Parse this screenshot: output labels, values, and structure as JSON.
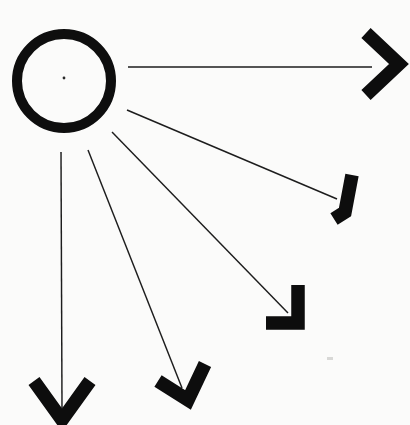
{
  "figure": {
    "background_color": "#fbfbfa",
    "ink_color": "#0d0d0d",
    "line_color": "#1d1d1d",
    "canvas": {
      "width": 410,
      "height": 425
    }
  },
  "ring": {
    "label": "ring",
    "center_x": 64,
    "center_y": 81,
    "outer_radius": 52,
    "stroke_width": 10,
    "color": "#0e0e0e"
  },
  "center_dot": {
    "label": "center-dot",
    "x": 64,
    "y": 78,
    "radius": 1.4,
    "color": "#2a2a2a"
  },
  "speck": {
    "label": "scan-speck",
    "x": 327,
    "y": 357,
    "width": 6,
    "height": 3,
    "color": "#d8d8d6"
  },
  "rays": [
    {
      "name": "ray-east",
      "index": 1,
      "start_x": 128,
      "start_y": 67,
      "end_x": 372,
      "end_y": 67,
      "angle_deg": 0,
      "arrow": {
        "name": "arrowhead-east",
        "tip_x": 399,
        "tip_y": 64,
        "arm_a_x": 366,
        "arm_a_y": 33,
        "arm_b_x": 366,
        "arm_b_y": 95
      }
    },
    {
      "name": "ray-southeast-upper",
      "index": 2,
      "start_x": 127,
      "start_y": 110,
      "end_x": 337,
      "end_y": 199,
      "angle_deg": 23,
      "arrow": {
        "name": "arrowhead-southeast-upper",
        "tip_x": 345,
        "tip_y": 212,
        "arm_a_x": 352,
        "arm_a_y": 175,
        "arm_b_x": 334,
        "arm_b_y": 219
      }
    },
    {
      "name": "ray-southeast-lower",
      "index": 3,
      "start_x": 112,
      "start_y": 132,
      "end_x": 288,
      "end_y": 313,
      "angle_deg": 46,
      "arrow": {
        "name": "arrowhead-southeast-lower",
        "tip_x": 298,
        "tip_y": 323,
        "arm_a_x": 298,
        "arm_a_y": 285,
        "arm_b_x": 266,
        "arm_b_y": 323
      }
    },
    {
      "name": "ray-southwest-lower",
      "index": 4,
      "start_x": 88,
      "start_y": 150,
      "end_x": 182,
      "end_y": 388,
      "angle_deg": 68,
      "arrow": {
        "name": "arrowhead-south-mid",
        "tip_x": 188,
        "tip_y": 400,
        "arm_a_x": 205,
        "arm_a_y": 364,
        "arm_b_x": 158,
        "arm_b_y": 381
      }
    },
    {
      "name": "ray-south",
      "index": 5,
      "start_x": 61,
      "start_y": 152,
      "end_x": 62,
      "end_y": 408,
      "angle_deg": 90,
      "arrow": {
        "name": "arrowhead-south",
        "tip_x": 62,
        "tip_y": 420,
        "arm_a_x": 34,
        "arm_a_y": 381,
        "arm_b_x": 90,
        "arm_b_y": 381
      }
    }
  ]
}
